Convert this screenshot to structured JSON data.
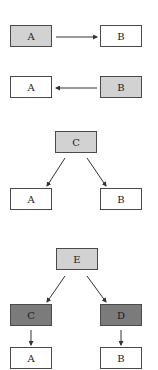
{
  "diagram": {
    "colors": {
      "white": "#ffffff",
      "light_gray": "#d2d2d2",
      "dark_gray": "#7b7b7b",
      "stroke": "#4a4a4a"
    },
    "panels": [
      {
        "id": "panel-1",
        "nodes": [
          {
            "id": "p1-a",
            "label": "A",
            "fill": "light_gray"
          },
          {
            "id": "p1-b",
            "label": "B",
            "fill": "white"
          }
        ],
        "edges": [
          {
            "from": "A",
            "to": "B"
          }
        ]
      },
      {
        "id": "panel-2",
        "nodes": [
          {
            "id": "p2-a",
            "label": "A",
            "fill": "white"
          },
          {
            "id": "p2-b",
            "label": "B",
            "fill": "light_gray"
          }
        ],
        "edges": [
          {
            "from": "B",
            "to": "A"
          }
        ]
      },
      {
        "id": "panel-3",
        "nodes": [
          {
            "id": "p3-c",
            "label": "C",
            "fill": "light_gray"
          },
          {
            "id": "p3-a",
            "label": "A",
            "fill": "white"
          },
          {
            "id": "p3-b",
            "label": "B",
            "fill": "white"
          }
        ],
        "edges": [
          {
            "from": "C",
            "to": "A"
          },
          {
            "from": "C",
            "to": "B"
          }
        ]
      },
      {
        "id": "panel-4",
        "nodes": [
          {
            "id": "p4-e",
            "label": "E",
            "fill": "light_gray"
          },
          {
            "id": "p4-c",
            "label": "C",
            "fill": "dark_gray"
          },
          {
            "id": "p4-d",
            "label": "D",
            "fill": "dark_gray"
          },
          {
            "id": "p4-a",
            "label": "A",
            "fill": "white"
          },
          {
            "id": "p4-b",
            "label": "B",
            "fill": "white"
          }
        ],
        "edges": [
          {
            "from": "E",
            "to": "C"
          },
          {
            "from": "E",
            "to": "D"
          },
          {
            "from": "C",
            "to": "A"
          },
          {
            "from": "D",
            "to": "B"
          }
        ]
      }
    ]
  }
}
